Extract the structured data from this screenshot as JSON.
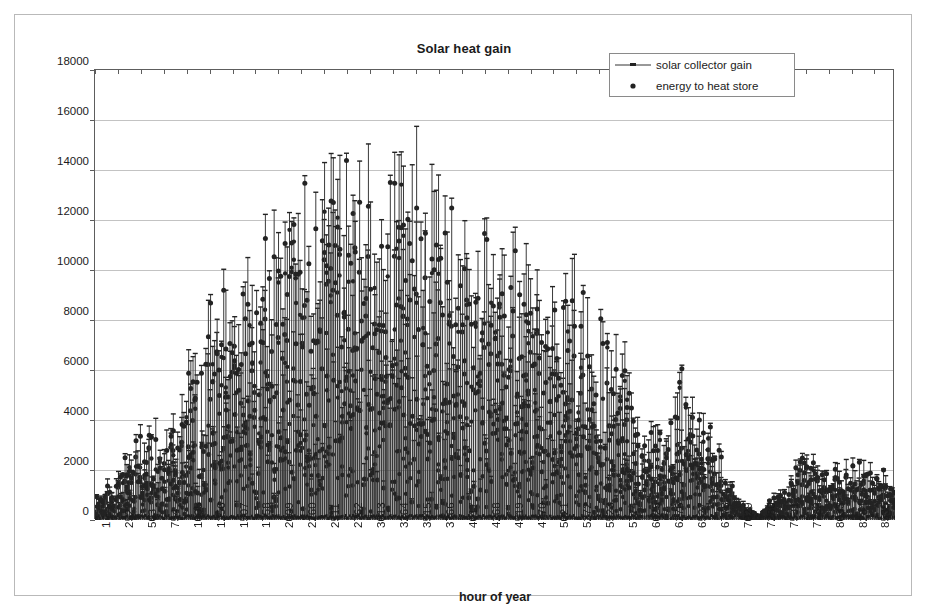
{
  "chart_data": {
    "type": "line",
    "title": "Solar heat gain",
    "xlabel": "hour of year",
    "ylabel": "W",
    "grid": true,
    "legend_position": "top-right",
    "xlim": [
      1,
      8760
    ],
    "ylim": [
      0,
      18000
    ],
    "y_ticks": [
      0,
      2000,
      4000,
      6000,
      8000,
      10000,
      12000,
      14000,
      16000,
      18000
    ],
    "x_ticks": [
      1,
      252,
      503,
      754,
      1005,
      1256,
      1507,
      1758,
      2009,
      2260,
      2511,
      2762,
      3013,
      3264,
      3515,
      3766,
      4017,
      4268,
      4519,
      4770,
      5021,
      5272,
      5523,
      5774,
      6025,
      6276,
      6527,
      6778,
      7029,
      7280,
      7531,
      7782,
      8033,
      8284,
      8535
    ],
    "x_tick_step": 251,
    "series": [
      {
        "name": "solar collector gain",
        "marker": "line-with-dash",
        "color": "#333333",
        "description": "vertical impulse line drawn from 0 W up to the hourly collector gain value",
        "peak_value": 16700,
        "peak_hour": 2850
      },
      {
        "name": "energy to heat store",
        "marker": "filled-circle",
        "color": "#222222",
        "description": "filled round marker plotted at the hourly energy delivered to the heat store",
        "peak_value": 16600,
        "peak_hour": 2850
      }
    ],
    "envelope_by_hour": [
      {
        "hour": 1,
        "max": 1300
      },
      {
        "hour": 250,
        "max": 2300
      },
      {
        "hour": 500,
        "max": 4300
      },
      {
        "hour": 750,
        "max": 4200
      },
      {
        "hour": 1000,
        "max": 7000
      },
      {
        "hour": 1250,
        "max": 9200
      },
      {
        "hour": 1500,
        "max": 11600
      },
      {
        "hour": 1750,
        "max": 12800
      },
      {
        "hour": 2000,
        "max": 13400
      },
      {
        "hour": 2250,
        "max": 13900
      },
      {
        "hour": 2500,
        "max": 15900
      },
      {
        "hour": 2750,
        "max": 16700
      },
      {
        "hour": 3000,
        "max": 16000
      },
      {
        "hour": 3250,
        "max": 15700
      },
      {
        "hour": 3500,
        "max": 16300
      },
      {
        "hour": 3750,
        "max": 14300
      },
      {
        "hour": 4000,
        "max": 14000
      },
      {
        "hour": 4250,
        "max": 12900
      },
      {
        "hour": 4500,
        "max": 12100
      },
      {
        "hour": 4750,
        "max": 12400
      },
      {
        "hour": 5000,
        "max": 10200
      },
      {
        "hour": 5250,
        "max": 11600
      },
      {
        "hour": 5500,
        "max": 9200
      },
      {
        "hour": 5750,
        "max": 8900
      },
      {
        "hour": 6000,
        "max": 4100
      },
      {
        "hour": 6250,
        "max": 4300
      },
      {
        "hour": 6500,
        "max": 7500
      },
      {
        "hour": 6750,
        "max": 4300
      },
      {
        "hour": 7000,
        "max": 1300
      },
      {
        "hour": 7250,
        "max": 200
      },
      {
        "hour": 7500,
        "max": 1500
      },
      {
        "hour": 7750,
        "max": 3400
      },
      {
        "hour": 8000,
        "max": 2200
      },
      {
        "hour": 8250,
        "max": 3000
      },
      {
        "hour": 8500,
        "max": 2400
      },
      {
        "hour": 8760,
        "max": 2000
      }
    ]
  },
  "chart": {
    "title": "Solar heat gain",
    "x_axis_label": "hour of year",
    "y_axis_label": "W"
  },
  "legend": {
    "entries": [
      {
        "label": "solar collector gain",
        "key": "line-marker"
      },
      {
        "label": "energy to heat store",
        "key": "dot-marker"
      }
    ]
  }
}
